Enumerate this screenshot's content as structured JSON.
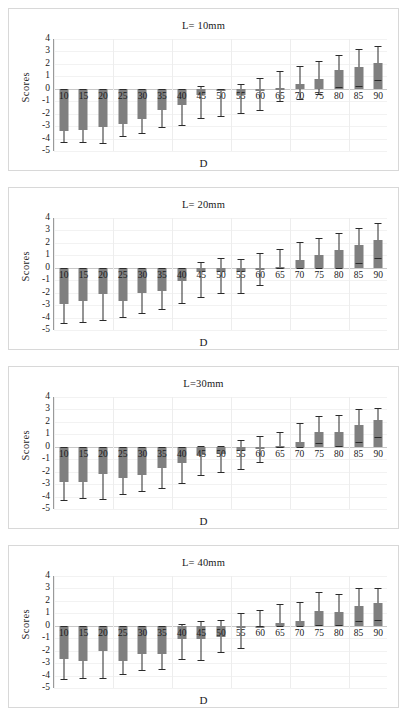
{
  "figure": {
    "ylabel": "Scores",
    "xlabel": "D",
    "bar_color": "#7f7f7f",
    "whisker_color": "#2b2b2b",
    "yticks": [
      "4",
      "3",
      "2",
      "1",
      "0",
      "-1",
      "-2",
      "-3",
      "-4",
      "-5"
    ],
    "categories": [
      "10",
      "15",
      "20",
      "25",
      "30",
      "35",
      "40",
      "45",
      "50",
      "55",
      "60",
      "65",
      "70",
      "75",
      "80",
      "85",
      "90"
    ]
  },
  "chart_data": [
    {
      "type": "bar",
      "title": "L= 10mm",
      "xlabel": "D",
      "ylabel": "Scores",
      "ylim": [
        -5,
        4
      ],
      "grid": true,
      "legend": "none",
      "categories": [
        "10",
        "15",
        "20",
        "25",
        "30",
        "35",
        "40",
        "45",
        "50",
        "55",
        "60",
        "65",
        "70",
        "75",
        "80",
        "85",
        "90"
      ],
      "values": [
        -3.4,
        -3.3,
        -3.1,
        -2.8,
        -2.4,
        -1.7,
        -1.3,
        -0.5,
        -0.15,
        -0.5,
        -0.2,
        0.05,
        0.4,
        0.8,
        1.5,
        1.75,
        2.05
      ],
      "err_low": [
        -4.3,
        -4.25,
        -4.35,
        -3.8,
        -3.55,
        -3.1,
        -2.9,
        -2.35,
        -2.15,
        -1.95,
        -1.7,
        -1.0,
        -0.8,
        -0.45,
        0.15,
        0.2,
        0.7
      ],
      "err_high": [
        -0.05,
        -0.05,
        -0.05,
        -0.05,
        -0.05,
        -0.05,
        -0.05,
        0.2,
        -0.05,
        0.35,
        0.85,
        1.4,
        1.85,
        2.25,
        2.75,
        3.2,
        3.45
      ]
    },
    {
      "type": "bar",
      "title": "L= 20mm",
      "xlabel": "D",
      "ylabel": "Scores",
      "ylim": [
        -5,
        4
      ],
      "grid": true,
      "legend": "none",
      "categories": [
        "10",
        "15",
        "20",
        "25",
        "30",
        "35",
        "40",
        "45",
        "50",
        "55",
        "60",
        "65",
        "70",
        "75",
        "80",
        "85",
        "90"
      ],
      "values": [
        -2.9,
        -2.7,
        -2.1,
        -2.7,
        -2.0,
        -1.9,
        -1.1,
        -0.35,
        -0.35,
        -0.35,
        -0.05,
        0.1,
        0.6,
        1.0,
        1.45,
        1.8,
        2.2
      ],
      "err_low": [
        -4.45,
        -4.35,
        -4.2,
        -3.95,
        -3.6,
        -3.3,
        -2.85,
        -2.35,
        -2.05,
        -2.0,
        -1.35,
        -0.05,
        -0.05,
        -0.05,
        -0.05,
        0.35,
        0.75
      ],
      "err_high": [
        -0.05,
        -0.05,
        -0.05,
        -0.05,
        -0.05,
        -0.05,
        -0.05,
        0.45,
        0.75,
        0.7,
        1.15,
        1.5,
        2.1,
        2.4,
        2.8,
        3.2,
        3.6
      ]
    },
    {
      "type": "bar",
      "title": "L=30mm",
      "xlabel": "D",
      "ylabel": "Scores",
      "ylim": [
        -5,
        4
      ],
      "grid": true,
      "legend": "none",
      "categories": [
        "10",
        "15",
        "20",
        "25",
        "30",
        "35",
        "40",
        "45",
        "50",
        "55",
        "60",
        "65",
        "70",
        "75",
        "80",
        "85",
        "90"
      ],
      "values": [
        -2.8,
        -2.8,
        -2.2,
        -2.5,
        -2.25,
        -1.7,
        -1.3,
        -0.7,
        -0.55,
        -0.35,
        -0.1,
        0.05,
        0.4,
        1.15,
        1.2,
        1.75,
        2.15
      ],
      "err_low": [
        -4.3,
        -4.15,
        -4.2,
        -3.8,
        -3.55,
        -3.3,
        -2.9,
        -2.3,
        -2.0,
        -1.8,
        -1.25,
        -0.05,
        -0.05,
        0.3,
        0.05,
        0.4,
        0.8
      ],
      "err_high": [
        -0.05,
        -0.05,
        -0.05,
        -0.05,
        -0.05,
        -0.05,
        -0.05,
        0.1,
        0.1,
        0.55,
        0.85,
        1.2,
        1.95,
        2.5,
        2.55,
        3.05,
        3.1
      ]
    },
    {
      "type": "bar",
      "title": "L= 40mm",
      "xlabel": "D",
      "ylabel": "Scores",
      "ylim": [
        -5,
        4
      ],
      "grid": true,
      "legend": "none",
      "categories": [
        "10",
        "15",
        "20",
        "25",
        "30",
        "35",
        "40",
        "45",
        "50",
        "55",
        "60",
        "65",
        "70",
        "75",
        "80",
        "85",
        "90"
      ],
      "values": [
        -2.65,
        -2.8,
        -2.05,
        -2.8,
        -2.3,
        -2.3,
        -1.1,
        -1.1,
        -0.9,
        -0.15,
        -0.05,
        0.2,
        0.4,
        1.15,
        1.1,
        1.6,
        1.85
      ],
      "err_low": [
        -4.3,
        -4.2,
        -4.2,
        -3.9,
        -3.55,
        -3.5,
        -2.7,
        -2.75,
        -2.1,
        -1.8,
        -0.05,
        -0.05,
        -0.05,
        0.1,
        0.05,
        0.4,
        0.45
      ],
      "err_high": [
        -0.05,
        -0.05,
        -0.05,
        -0.05,
        -0.05,
        -0.05,
        0.15,
        0.4,
        0.45,
        1.0,
        1.25,
        1.75,
        1.9,
        2.7,
        2.55,
        3.0,
        3.0
      ]
    }
  ]
}
